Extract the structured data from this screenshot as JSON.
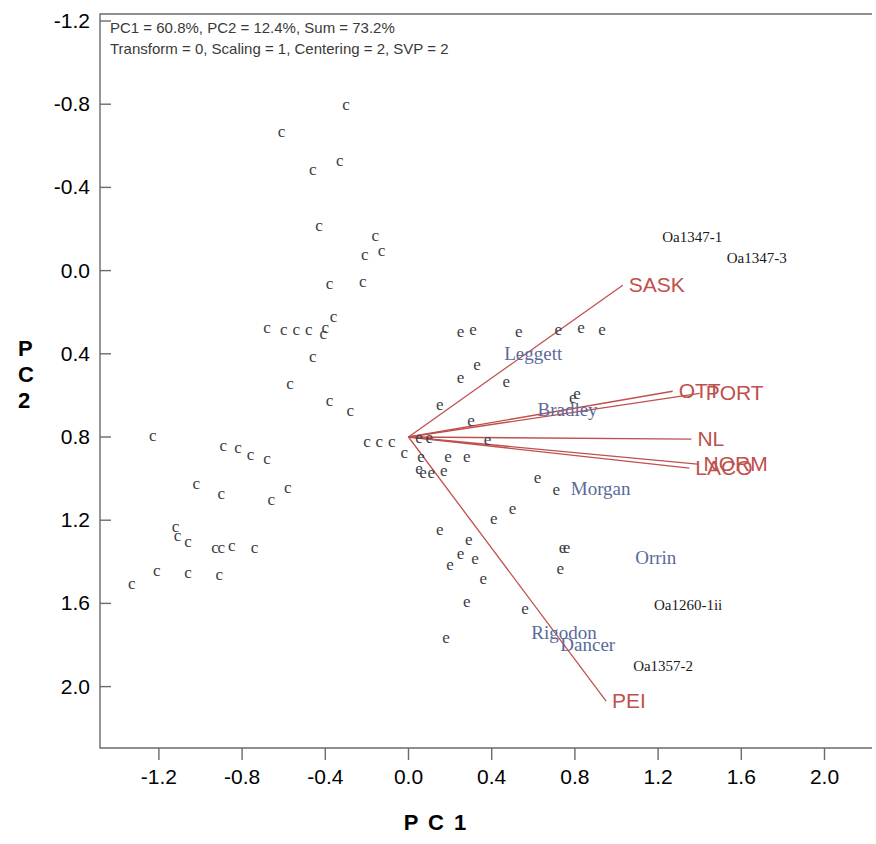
{
  "header": {
    "line1": "PC1 = 60.8%, PC2 = 12.4%, Sum = 73.2%",
    "line2": "Transform = 0, Scaling = 1, Centering = 2, SVP = 2",
    "pc1_variance": "60.8%",
    "pc2_variance": "12.4%",
    "sum_variance": "73.2%",
    "transform": "0",
    "scaling": "1",
    "centering": "2",
    "svp": "2"
  },
  "axes": {
    "x_title": "P C 1",
    "y_title_chars": [
      "P",
      "C",
      "2"
    ],
    "y_title": "P C 2",
    "x_ticks": [
      "-1.2",
      "-0.8",
      "-0.4",
      "0.0",
      "0.4",
      "0.8",
      "1.2",
      "1.6",
      "2.0"
    ],
    "y_ticks": [
      "2.0",
      "1.6",
      "1.2",
      "0.8",
      "0.4",
      "0.0",
      "-0.4",
      "-0.8",
      "-1.2"
    ]
  },
  "colors": {
    "vector": "#c0504d",
    "blue_label": "#5a6a9a",
    "black_label": "#1a1a1a",
    "point": "#3d3d46",
    "frame": "#6b6b6b"
  },
  "chart_data": {
    "type": "scatter",
    "title": "PC1 = 60.8%, PC2 = 12.4%, Sum = 73.2%",
    "subtitle": "Transform = 0, Scaling = 1, Centering = 2, SVP = 2",
    "xlabel": "P C 1",
    "ylabel": "P C 2",
    "xlim": [
      -1.55,
      2.2
    ],
    "ylim": [
      -1.45,
      2.05
    ],
    "xticks": [
      -1.2,
      -0.8,
      -0.4,
      0.0,
      0.4,
      0.8,
      1.2,
      1.6,
      2.0
    ],
    "yticks": [
      -1.2,
      -0.8,
      -0.4,
      0.0,
      0.4,
      0.8,
      1.2,
      1.6,
      2.0
    ],
    "grid": false,
    "legend": "none",
    "groups": [
      {
        "name": "c",
        "marker_text": "c",
        "points": [
          [
            -0.3,
            1.6
          ],
          [
            -0.61,
            1.47
          ],
          [
            -0.46,
            1.29
          ],
          [
            -0.33,
            1.33
          ],
          [
            -0.43,
            1.02
          ],
          [
            -0.16,
            0.97
          ],
          [
            -0.21,
            0.88
          ],
          [
            -0.13,
            0.9
          ],
          [
            -0.22,
            0.75
          ],
          [
            -0.38,
            0.74
          ],
          [
            -0.36,
            0.58
          ],
          [
            -0.68,
            0.53
          ],
          [
            -0.6,
            0.52
          ],
          [
            -0.54,
            0.52
          ],
          [
            -0.48,
            0.52
          ],
          [
            -0.41,
            0.5
          ],
          [
            -0.4,
            0.53
          ],
          [
            -0.46,
            0.39
          ],
          [
            -0.57,
            0.26
          ],
          [
            -0.38,
            0.18
          ],
          [
            -0.28,
            0.13
          ],
          [
            -1.23,
            0.01
          ],
          [
            -0.89,
            -0.04
          ],
          [
            -0.82,
            -0.05
          ],
          [
            -0.76,
            -0.08
          ],
          [
            -0.68,
            -0.1
          ],
          [
            -0.08,
            -0.02
          ],
          [
            -0.14,
            -0.02
          ],
          [
            -0.2,
            -0.02
          ],
          [
            -0.02,
            -0.07
          ],
          [
            -1.02,
            -0.22
          ],
          [
            -0.9,
            -0.27
          ],
          [
            -0.58,
            -0.24
          ],
          [
            -0.66,
            -0.3
          ],
          [
            -1.12,
            -0.43
          ],
          [
            -1.11,
            -0.47
          ],
          [
            -1.06,
            -0.5
          ],
          [
            -0.93,
            -0.53
          ],
          [
            -0.9,
            -0.53
          ],
          [
            -0.85,
            -0.52
          ],
          [
            -0.74,
            -0.53
          ],
          [
            -1.21,
            -0.64
          ],
          [
            -1.06,
            -0.65
          ],
          [
            -0.91,
            -0.66
          ],
          [
            -1.33,
            -0.7
          ]
        ]
      },
      {
        "name": "e",
        "marker_text": "e",
        "points": [
          [
            0.93,
            0.52
          ],
          [
            0.83,
            0.53
          ],
          [
            0.72,
            0.52
          ],
          [
            0.53,
            0.51
          ],
          [
            0.31,
            0.52
          ],
          [
            0.25,
            0.51
          ],
          [
            0.33,
            0.35
          ],
          [
            0.25,
            0.29
          ],
          [
            0.47,
            0.27
          ],
          [
            0.79,
            0.19
          ],
          [
            0.81,
            0.21
          ],
          [
            0.15,
            0.16
          ],
          [
            0.3,
            0.08
          ],
          [
            0.05,
            0.0
          ],
          [
            0.1,
            0.0
          ],
          [
            0.38,
            -0.01
          ],
          [
            0.06,
            -0.09
          ],
          [
            0.19,
            -0.09
          ],
          [
            0.28,
            -0.09
          ],
          [
            0.05,
            -0.15
          ],
          [
            0.07,
            -0.17
          ],
          [
            0.11,
            -0.17
          ],
          [
            0.17,
            -0.16
          ],
          [
            0.62,
            -0.19
          ],
          [
            0.71,
            -0.25
          ],
          [
            0.5,
            -0.34
          ],
          [
            0.41,
            -0.39
          ],
          [
            0.15,
            -0.44
          ],
          [
            0.29,
            -0.49
          ],
          [
            0.74,
            -0.53
          ],
          [
            0.76,
            -0.53
          ],
          [
            0.25,
            -0.56
          ],
          [
            0.32,
            -0.58
          ],
          [
            0.2,
            -0.61
          ],
          [
            0.73,
            -0.63
          ],
          [
            0.36,
            -0.68
          ],
          [
            0.28,
            -0.79
          ],
          [
            0.56,
            -0.82
          ],
          [
            0.18,
            -0.96
          ]
        ]
      }
    ],
    "vectors": [
      {
        "label": "SASK",
        "x": 1.03,
        "y": 0.73
      },
      {
        "label": "OTT",
        "x": 1.27,
        "y": 0.22
      },
      {
        "label": "PORT",
        "x": 1.4,
        "y": 0.21
      },
      {
        "label": "NL",
        "x": 1.36,
        "y": -0.01
      },
      {
        "label": "NORM",
        "x": 1.39,
        "y": -0.13
      },
      {
        "label": "LACO",
        "x": 1.35,
        "y": -0.15
      },
      {
        "label": "PEI",
        "x": 0.95,
        "y": -1.27
      }
    ],
    "blue_labels": [
      {
        "text": "Leggett",
        "x": 0.46,
        "y": 0.4
      },
      {
        "text": "Bradley",
        "x": 0.62,
        "y": 0.13
      },
      {
        "text": "Morgan",
        "x": 0.78,
        "y": -0.25
      },
      {
        "text": "Orrin",
        "x": 1.09,
        "y": -0.58
      },
      {
        "text": "Rigodon",
        "x": 0.59,
        "y": -0.94
      },
      {
        "text": "Dancer",
        "x": 0.73,
        "y": -1.0
      }
    ],
    "black_labels": [
      {
        "text": "Oa1347-1",
        "x": 1.22,
        "y": 0.96
      },
      {
        "text": "Oa1347-3",
        "x": 1.53,
        "y": 0.86
      },
      {
        "text": "Oa1260-1ii",
        "x": 1.18,
        "y": -0.81
      },
      {
        "text": "Oa1357-2",
        "x": 1.08,
        "y": -1.1
      }
    ]
  }
}
